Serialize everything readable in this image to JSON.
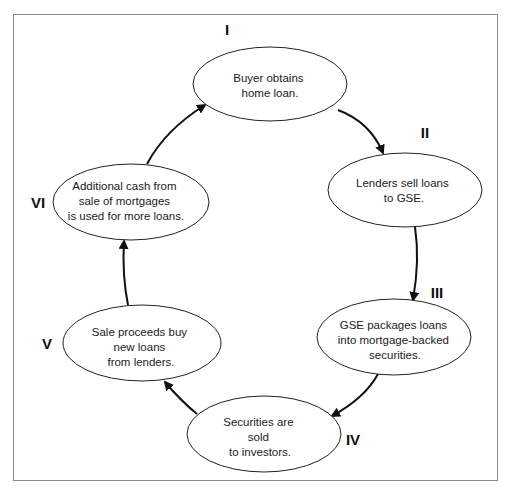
{
  "diagram": {
    "type": "cycle",
    "colors": {
      "stroke": "#111111",
      "frame": "#8a8a8a",
      "text": "#222222",
      "background": "#ffffff"
    },
    "nodes": [
      {
        "id": "I",
        "label": "I",
        "lines": [
          "Buyer obtains",
          "home loan."
        ]
      },
      {
        "id": "II",
        "label": "II",
        "lines": [
          "Lenders sell loans",
          "to GSE."
        ]
      },
      {
        "id": "III",
        "label": "III",
        "lines": [
          "GSE packages loans",
          "into mortgage-backed",
          "securities."
        ]
      },
      {
        "id": "IV",
        "label": "IV",
        "lines": [
          "Securities are",
          "sold",
          "to investors."
        ]
      },
      {
        "id": "V",
        "label": "V",
        "lines": [
          "Sale proceeds buy",
          "new loans",
          "from lenders."
        ]
      },
      {
        "id": "VI",
        "label": "VI",
        "lines": [
          "Additional cash from",
          "sale of mortgages",
          "is used for more loans."
        ]
      }
    ],
    "edges": [
      {
        "from": "I",
        "to": "II"
      },
      {
        "from": "II",
        "to": "III"
      },
      {
        "from": "III",
        "to": "IV"
      },
      {
        "from": "IV",
        "to": "V"
      },
      {
        "from": "V",
        "to": "VI"
      },
      {
        "from": "VI",
        "to": "I"
      }
    ]
  }
}
